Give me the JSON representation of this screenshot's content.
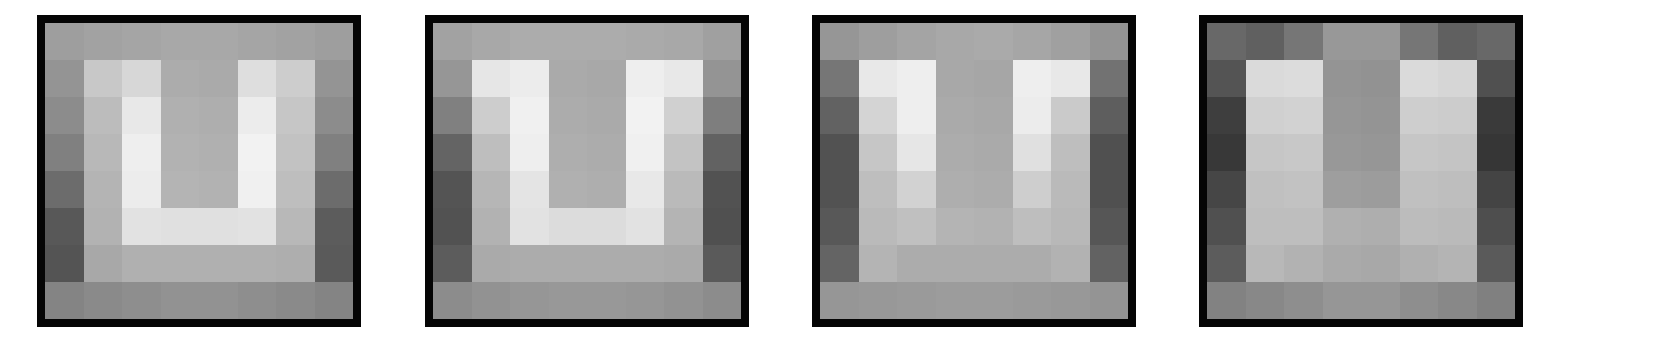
{
  "figure": {
    "grid_size": [
      8,
      8
    ],
    "border_color": "#050505",
    "background": "#ffffff"
  },
  "panels": [
    {
      "id": "panel-1",
      "left": 37,
      "pixels": [
        [
          158,
          162,
          165,
          168,
          168,
          165,
          162,
          158
        ],
        [
          148,
          200,
          215,
          172,
          170,
          222,
          205,
          148
        ],
        [
          140,
          188,
          232,
          176,
          174,
          236,
          198,
          140
        ],
        [
          128,
          184,
          238,
          178,
          176,
          242,
          194,
          128
        ],
        [
          108,
          180,
          236,
          180,
          178,
          240,
          190,
          108
        ],
        [
          88,
          178,
          226,
          224,
          224,
          226,
          184,
          92
        ],
        [
          84,
          168,
          176,
          176,
          176,
          176,
          174,
          90
        ],
        [
          132,
          138,
          142,
          146,
          146,
          142,
          138,
          132
        ]
      ]
    },
    {
      "id": "panel-2",
      "left": 425,
      "pixels": [
        [
          162,
          168,
          172,
          172,
          172,
          170,
          168,
          160
        ],
        [
          150,
          230,
          236,
          170,
          168,
          238,
          232,
          148
        ],
        [
          128,
          205,
          240,
          172,
          170,
          242,
          208,
          126
        ],
        [
          100,
          190,
          238,
          174,
          172,
          240,
          195,
          98
        ],
        [
          84,
          182,
          228,
          176,
          174,
          232,
          186,
          82
        ],
        [
          82,
          178,
          226,
          220,
          220,
          226,
          180,
          80
        ],
        [
          92,
          170,
          172,
          172,
          172,
          172,
          170,
          90
        ],
        [
          140,
          146,
          150,
          152,
          152,
          150,
          146,
          140
        ]
      ]
    },
    {
      "id": "panel-3",
      "left": 812,
      "pixels": [
        [
          150,
          158,
          164,
          168,
          170,
          166,
          160,
          148
        ],
        [
          118,
          232,
          238,
          168,
          166,
          238,
          232,
          114
        ],
        [
          98,
          212,
          238,
          170,
          168,
          236,
          202,
          94
        ],
        [
          82,
          198,
          230,
          172,
          170,
          224,
          190,
          80
        ],
        [
          82,
          190,
          210,
          174,
          172,
          206,
          186,
          80
        ],
        [
          88,
          186,
          192,
          180,
          178,
          190,
          184,
          86
        ],
        [
          100,
          180,
          172,
          172,
          172,
          172,
          178,
          98
        ],
        [
          150,
          152,
          154,
          156,
          156,
          154,
          152,
          148
        ]
      ]
    },
    {
      "id": "panel-4",
      "left": 1199,
      "pixels": [
        [
          104,
          96,
          118,
          152,
          152,
          118,
          96,
          104
        ],
        [
          84,
          218,
          220,
          148,
          146,
          218,
          214,
          80
        ],
        [
          62,
          208,
          210,
          150,
          148,
          206,
          204,
          58
        ],
        [
          56,
          198,
          200,
          152,
          150,
          198,
          196,
          54
        ],
        [
          70,
          192,
          194,
          158,
          156,
          192,
          190,
          68
        ],
        [
          80,
          190,
          190,
          176,
          174,
          188,
          186,
          78
        ],
        [
          92,
          184,
          178,
          170,
          168,
          176,
          180,
          90
        ],
        [
          130,
          136,
          142,
          150,
          150,
          142,
          136,
          128
        ]
      ]
    }
  ]
}
